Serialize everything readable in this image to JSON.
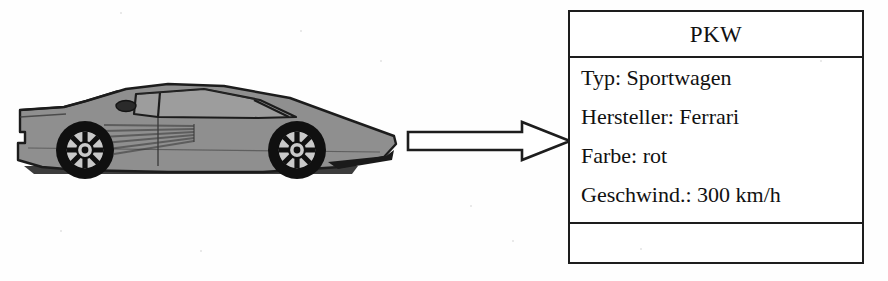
{
  "figure": {
    "background_color": "#fefefe",
    "width": 888,
    "height": 281
  },
  "illustration": {
    "name": "sports-car-side-view",
    "description": "Ferrari Testarossa side profile, facing right",
    "body_color": "#8f8f8f",
    "outline_color": "#1c1c1c",
    "wheel_color": "#111111",
    "rim_color": "#c9c9c9",
    "glass_color": "#9b9b9b"
  },
  "arrow": {
    "name": "transformation-arrow",
    "direction": "right",
    "fill": "#ffffff",
    "stroke": "#1d1d1d"
  },
  "uml_class": {
    "class_name": "PKW",
    "attributes": [
      "Typ: Sportwagen",
      "Hersteller: Ferrari",
      "Farbe: rot",
      "Geschwind.: 300 km/h"
    ],
    "operations": [],
    "border_color": "#1d1d1d",
    "background_color": "#ffffff",
    "text_color": "#111111"
  }
}
